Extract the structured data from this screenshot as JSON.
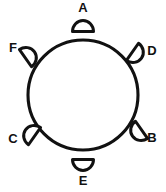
{
  "figure": {
    "type": "circular-node-diagram",
    "title": "",
    "background_color": "#ffffff",
    "stroke_color": "#111111",
    "fill_color": "#ffffff",
    "canvas": {
      "width": 166,
      "height": 192
    }
  },
  "ring": {
    "name": "main-circle",
    "center_x": 83,
    "center_y": 95,
    "radius": 55,
    "stroke_width": 3.1,
    "filled": false
  },
  "nodes": [
    {
      "id": "A",
      "label": "A",
      "shape": "half-disc",
      "position": "top",
      "angle_deg": 90,
      "flat_side_facing": "circle-center",
      "shape_cx": 83,
      "shape_cy": 26,
      "rotation_deg": 0,
      "label_x": 83,
      "label_y": 9
    },
    {
      "id": "D",
      "label": "D",
      "shape": "half-disc",
      "position": "upper-right",
      "angle_deg": 35,
      "flat_side_facing": "circle-center",
      "shape_cx": 137,
      "shape_cy": 55,
      "rotation_deg": 125,
      "label_x": 152,
      "label_y": 52
    },
    {
      "id": "B",
      "label": "B",
      "shape": "half-disc",
      "position": "lower-right",
      "angle_deg": -35,
      "flat_side_facing": "circle-center",
      "shape_cx": 137,
      "shape_cy": 133,
      "rotation_deg": 235,
      "label_x": 152,
      "label_y": 139
    },
    {
      "id": "E",
      "label": "E",
      "shape": "half-disc",
      "position": "bottom",
      "angle_deg": 270,
      "flat_side_facing": "circle-center",
      "shape_cx": 83,
      "shape_cy": 165,
      "rotation_deg": 180,
      "label_x": 83,
      "label_y": 182
    },
    {
      "id": "C",
      "label": "C",
      "shape": "half-disc",
      "position": "lower-left",
      "angle_deg": 215,
      "flat_side_facing": "circle-center",
      "shape_cx": 30,
      "shape_cy": 133,
      "rotation_deg": 305,
      "label_x": 13,
      "label_y": 140
    },
    {
      "id": "F",
      "label": "F",
      "shape": "half-disc",
      "position": "upper-left",
      "angle_deg": 145,
      "flat_side_facing": "circle-center",
      "shape_cx": 30,
      "shape_cy": 55,
      "rotation_deg": 55,
      "label_x": 13,
      "label_y": 49
    }
  ]
}
